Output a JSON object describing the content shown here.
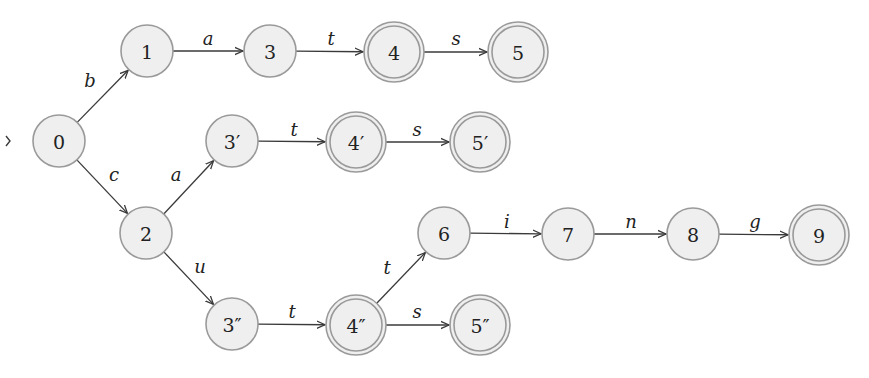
{
  "diagram": {
    "type": "finite-state-automaton",
    "colors": {
      "node_fill": "#efefef",
      "node_stroke": "#9a9a9a",
      "edge": "#3a3a3a",
      "text": "#222222"
    },
    "start_state": "0",
    "states": [
      {
        "id": "0",
        "label": "0",
        "x": 59,
        "y": 141,
        "accepting": false
      },
      {
        "id": "1",
        "label": "1",
        "x": 147,
        "y": 51,
        "accepting": false
      },
      {
        "id": "3",
        "label": "3",
        "x": 270,
        "y": 51,
        "accepting": false
      },
      {
        "id": "4",
        "label": "4",
        "x": 394,
        "y": 52,
        "accepting": true
      },
      {
        "id": "5",
        "label": "5",
        "x": 518,
        "y": 52,
        "accepting": true
      },
      {
        "id": "2",
        "label": "2",
        "x": 146,
        "y": 233,
        "accepting": false
      },
      {
        "id": "3p",
        "label": "3′",
        "x": 232,
        "y": 141,
        "accepting": false
      },
      {
        "id": "4p",
        "label": "4′",
        "x": 356,
        "y": 142,
        "accepting": true
      },
      {
        "id": "5p",
        "label": "5′",
        "x": 480,
        "y": 142,
        "accepting": true
      },
      {
        "id": "3pp",
        "label": "3″",
        "x": 232,
        "y": 324,
        "accepting": false
      },
      {
        "id": "4pp",
        "label": "4″",
        "x": 356,
        "y": 325,
        "accepting": true
      },
      {
        "id": "5pp",
        "label": "5″",
        "x": 480,
        "y": 325,
        "accepting": true
      },
      {
        "id": "6",
        "label": "6",
        "x": 444,
        "y": 233,
        "accepting": false
      },
      {
        "id": "7",
        "label": "7",
        "x": 568,
        "y": 234,
        "accepting": false
      },
      {
        "id": "8",
        "label": "8",
        "x": 693,
        "y": 234,
        "accepting": false
      },
      {
        "id": "9",
        "label": "9",
        "x": 819,
        "y": 235,
        "accepting": true
      }
    ],
    "transitions": [
      {
        "from": "0",
        "to": "1",
        "label": "b",
        "lx": 90,
        "ly": 80
      },
      {
        "from": "1",
        "to": "3",
        "label": "a",
        "lx": 208,
        "ly": 38
      },
      {
        "from": "3",
        "to": "4",
        "label": "t",
        "lx": 331,
        "ly": 38
      },
      {
        "from": "4",
        "to": "5",
        "label": "s",
        "lx": 456,
        "ly": 38
      },
      {
        "from": "0",
        "to": "2",
        "label": "c",
        "lx": 114,
        "ly": 174
      },
      {
        "from": "2",
        "to": "3p",
        "label": "a",
        "lx": 176,
        "ly": 174
      },
      {
        "from": "3p",
        "to": "4p",
        "label": "t",
        "lx": 294,
        "ly": 129
      },
      {
        "from": "4p",
        "to": "5p",
        "label": "s",
        "lx": 417,
        "ly": 129
      },
      {
        "from": "2",
        "to": "3pp",
        "label": "u",
        "lx": 200,
        "ly": 266
      },
      {
        "from": "3pp",
        "to": "4pp",
        "label": "t",
        "lx": 292,
        "ly": 311
      },
      {
        "from": "4pp",
        "to": "5pp",
        "label": "s",
        "lx": 417,
        "ly": 311
      },
      {
        "from": "4pp",
        "to": "6",
        "label": "t",
        "lx": 387,
        "ly": 267
      },
      {
        "from": "6",
        "to": "7",
        "label": "i",
        "lx": 507,
        "ly": 221
      },
      {
        "from": "7",
        "to": "8",
        "label": "n",
        "lx": 631,
        "ly": 221
      },
      {
        "from": "8",
        "to": "9",
        "label": "g",
        "lx": 755,
        "ly": 221
      }
    ]
  }
}
